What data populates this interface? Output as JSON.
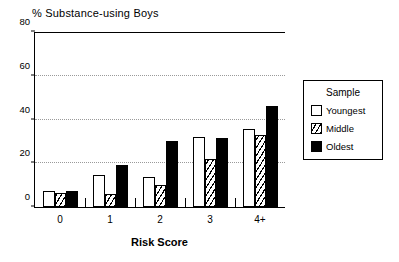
{
  "chart_data": {
    "type": "bar",
    "title": "% Substance-using Boys",
    "xlabel": "Risk Score",
    "ylabel": "",
    "categories": [
      "0",
      "1",
      "2",
      "3",
      "4+"
    ],
    "series": [
      {
        "name": "Youngest",
        "fill": "white",
        "values": [
          7.5,
          14.5,
          13.5,
          32.0,
          35.5
        ]
      },
      {
        "name": "Middle",
        "fill": "hatched",
        "values": [
          6.5,
          6.0,
          10.0,
          22.0,
          33.0
        ]
      },
      {
        "name": "Oldest",
        "fill": "black",
        "values": [
          7.5,
          19.0,
          30.0,
          31.5,
          46.0
        ]
      }
    ],
    "ylim": [
      0,
      80
    ],
    "yticks": [
      0,
      20,
      40,
      60,
      80
    ],
    "grid": "horizontal-dotted",
    "legend_position": "right-outside"
  },
  "legend": {
    "title": "Sample",
    "entries": [
      {
        "label": "Youngest",
        "swatch": "white-square-icon"
      },
      {
        "label": "Middle",
        "swatch": "hatched-square-icon"
      },
      {
        "label": "Oldest",
        "swatch": "black-square-icon"
      }
    ]
  },
  "colors": {
    "axis": "#000000",
    "grid": "#9a9a9a",
    "oldest": "#000000",
    "youngest": "#ffffff",
    "background": "#ffffff"
  }
}
